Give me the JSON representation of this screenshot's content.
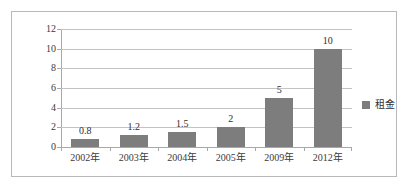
{
  "chart_data": {
    "type": "bar",
    "title": "",
    "subtitle": "",
    "xlabel": "",
    "ylabel": "",
    "categories": [
      "2002年",
      "2003年",
      "2004年",
      "2005年",
      "2009年",
      "2012年"
    ],
    "values": [
      0.8,
      1.2,
      1.5,
      2,
      5,
      10
    ],
    "value_labels": [
      "0.8",
      "1.2",
      "1.5",
      "2",
      "5",
      "10"
    ],
    "series": [
      {
        "name": "租金",
        "values": [
          0.8,
          1.2,
          1.5,
          2,
          5,
          10
        ],
        "color": "#7d7d7d"
      }
    ],
    "ylim": [
      0,
      12
    ],
    "ytick_values": [
      0,
      2,
      4,
      6,
      8,
      10,
      12
    ],
    "ytick_labels": [
      "0",
      "2",
      "4",
      "6",
      "8",
      "10",
      "12"
    ],
    "grid": true,
    "grid_axis": "y",
    "legend": {
      "position": "right",
      "entries": [
        {
          "label": "租金",
          "color": "#7d7d7d"
        }
      ]
    },
    "colors": {
      "bar": "#7d7d7d",
      "gridline": "#c3c3c3",
      "axis": "#a8a8a8",
      "frame": "#b9b9b9",
      "text": "#2e2e2e",
      "background": "#ffffff"
    }
  }
}
